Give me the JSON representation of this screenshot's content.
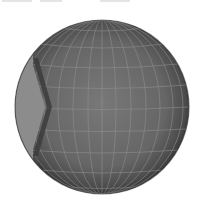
{
  "scene": {
    "subject": "grid sphere",
    "sphere": {
      "cx": 102,
      "cy": 107,
      "r": 87
    },
    "colors": {
      "background": "#ffffff",
      "sphere_center": "#727272",
      "sphere_edge": "#3e3e3e",
      "lit_crescent": "#8c8c8c",
      "terminator": "#3a3a3a",
      "grid_line": "#9a9a9a"
    },
    "grid": {
      "meridians": 12,
      "parallels": 10
    }
  }
}
